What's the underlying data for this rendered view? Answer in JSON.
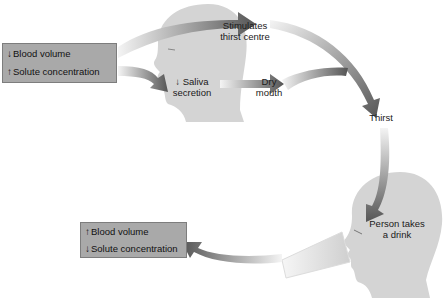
{
  "diagram": {
    "title": "",
    "type": "flow-cycle",
    "nodes": {
      "start_box": {
        "rows": [
          {
            "arrow": "↓",
            "label": "Blood volume"
          },
          {
            "arrow": "↑",
            "label": "Solute concentration"
          }
        ]
      },
      "saliva": {
        "arrow": "↓",
        "line1": "Saliva",
        "line2": "secretion"
      },
      "thirst_centre": {
        "line1": "Stimulates",
        "line2": "thirst centre"
      },
      "dry_mouth": {
        "line1": "Dry",
        "line2": "mouth"
      },
      "thirst": {
        "label": "Thirst"
      },
      "drink": {
        "line1": "Person takes",
        "line2": "a drink"
      },
      "end_box": {
        "rows": [
          {
            "arrow": "↑",
            "label": "Blood volume"
          },
          {
            "arrow": "↓",
            "label": "Solute concentration"
          }
        ]
      }
    },
    "edges": [
      {
        "from": "start_box",
        "to": "thirst_centre"
      },
      {
        "from": "start_box",
        "to": "saliva"
      },
      {
        "from": "saliva",
        "to": "dry_mouth"
      },
      {
        "from": "thirst_centre",
        "to": "thirst"
      },
      {
        "from": "dry_mouth",
        "to": "thirst"
      },
      {
        "from": "thirst",
        "to": "drink"
      },
      {
        "from": "drink",
        "to": "end_box"
      }
    ],
    "colors": {
      "box_fill": "#a9a9a9",
      "head_fill": "#d4d4d4",
      "arrow_dark": "#5a5a5a",
      "arrow_light": "#f2f2f2"
    }
  }
}
